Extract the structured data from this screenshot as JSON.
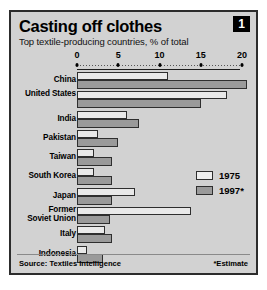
{
  "header": {
    "title": "Casting off clothes",
    "subtitle": "Top textile-producing countries, % of total",
    "badge": "1"
  },
  "footer": {
    "source": "Source: Textiles Intelligence",
    "estimate_note": "*Estimate"
  },
  "legend": {
    "items": [
      {
        "label": "1975",
        "color": "#eeeeee"
      },
      {
        "label": "1997*",
        "color": "#9a9a9a"
      }
    ]
  },
  "chart_data": {
    "type": "bar",
    "orientation": "horizontal",
    "title": "Casting off clothes",
    "subtitle": "Top textile-producing countries, % of total",
    "xlabel": "% of total",
    "ylabel": "",
    "xlim": [
      0,
      20
    ],
    "xticks": [
      0,
      5,
      10,
      15,
      20
    ],
    "xtick_labels": [
      "0",
      "5",
      "10",
      "15",
      "20"
    ],
    "grid": false,
    "legend_position": "middle-right",
    "categories": [
      "China",
      "United States",
      "India",
      "Pakistan",
      "Taiwan",
      "South Korea",
      "Japan",
      "Former Soviet Union",
      "Italy",
      "Indonesia"
    ],
    "series": [
      {
        "name": "1975",
        "color": "#eeeeee",
        "values": [
          11.0,
          18.2,
          6.0,
          2.6,
          2.1,
          2.1,
          7.0,
          13.8,
          3.4,
          1.2
        ]
      },
      {
        "name": "1997*",
        "color": "#9a9a9a",
        "values": [
          20.6,
          15.0,
          7.5,
          5.0,
          4.3,
          4.3,
          4.2,
          4.0,
          4.3,
          3.2
        ]
      }
    ],
    "annotations": [
      "*Estimate"
    ],
    "source": "Source: Textiles Intelligence"
  }
}
